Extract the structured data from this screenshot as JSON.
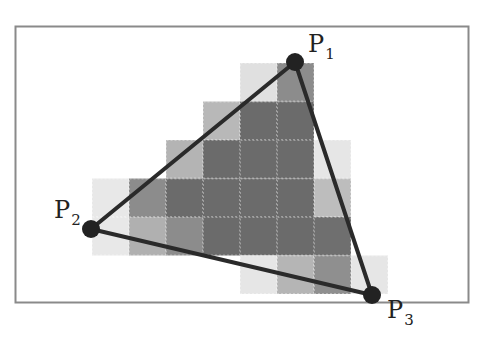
{
  "diagram": {
    "type": "triangle-rasterization",
    "frame": {
      "x": 15,
      "y": 26,
      "width": 454,
      "height": 277,
      "stroke": "#8a8a8a"
    },
    "grid": {
      "origin_x": 92,
      "origin_y": 63,
      "cell_w": 37,
      "cell_h": 38.5,
      "cells": [
        {
          "row": 0,
          "col": 4,
          "shade": "#e0e0e0"
        },
        {
          "row": 0,
          "col": 5,
          "shade": "#8c8c8c"
        },
        {
          "row": 1,
          "col": 3,
          "shade": "#b8b8b8"
        },
        {
          "row": 1,
          "col": 4,
          "shade": "#6b6b6b"
        },
        {
          "row": 1,
          "col": 5,
          "shade": "#6b6b6b"
        },
        {
          "row": 2,
          "col": 2,
          "shade": "#b4b4b4"
        },
        {
          "row": 2,
          "col": 3,
          "shade": "#6b6b6b"
        },
        {
          "row": 2,
          "col": 4,
          "shade": "#6b6b6b"
        },
        {
          "row": 2,
          "col": 5,
          "shade": "#6b6b6b"
        },
        {
          "row": 2,
          "col": 6,
          "shade": "#e6e6e6"
        },
        {
          "row": 3,
          "col": 0,
          "shade": "#e8e8e8"
        },
        {
          "row": 3,
          "col": 1,
          "shade": "#8c8c8c"
        },
        {
          "row": 3,
          "col": 2,
          "shade": "#6b6b6b"
        },
        {
          "row": 3,
          "col": 3,
          "shade": "#6b6b6b"
        },
        {
          "row": 3,
          "col": 4,
          "shade": "#6b6b6b"
        },
        {
          "row": 3,
          "col": 5,
          "shade": "#6b6b6b"
        },
        {
          "row": 3,
          "col": 6,
          "shade": "#bdbdbd"
        },
        {
          "row": 4,
          "col": 0,
          "shade": "#e8e8e8"
        },
        {
          "row": 4,
          "col": 1,
          "shade": "#b0b0b0"
        },
        {
          "row": 4,
          "col": 2,
          "shade": "#8c8c8c"
        },
        {
          "row": 4,
          "col": 3,
          "shade": "#6b6b6b"
        },
        {
          "row": 4,
          "col": 4,
          "shade": "#6b6b6b"
        },
        {
          "row": 4,
          "col": 5,
          "shade": "#6b6b6b"
        },
        {
          "row": 4,
          "col": 6,
          "shade": "#6f6f6f"
        },
        {
          "row": 5,
          "col": 4,
          "shade": "#e6e6e6"
        },
        {
          "row": 5,
          "col": 5,
          "shade": "#b5b5b5"
        },
        {
          "row": 5,
          "col": 6,
          "shade": "#8f8f8f"
        },
        {
          "row": 5,
          "col": 7,
          "shade": "#e6e6e6"
        }
      ]
    },
    "vertices": [
      {
        "id": "P1",
        "label": "P",
        "sub": "1",
        "x": 295,
        "y": 62,
        "label_x": 308,
        "label_y": 52
      },
      {
        "id": "P2",
        "label": "P",
        "sub": "2",
        "x": 91,
        "y": 229,
        "label_x": 54,
        "label_y": 218
      },
      {
        "id": "P3",
        "label": "P",
        "sub": "3",
        "x": 372,
        "y": 295,
        "label_x": 387,
        "label_y": 318
      }
    ],
    "edge_color": "#2a2a2a",
    "vertex_color": "#222222"
  }
}
